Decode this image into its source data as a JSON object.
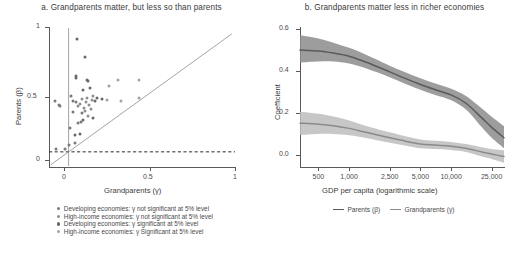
{
  "figure": {
    "width": 526,
    "height": 257,
    "background": "#ffffff"
  },
  "colors": {
    "parents_line": "#5a5a5a",
    "parents_band": "#8c8c8c",
    "grandparents_line": "#8a8a8a",
    "grandparents_band": "#bdbdbd",
    "axis": "#595959",
    "dashed_zero": "#2f2f2f",
    "dot_dev_ns": "#7a7a7a",
    "dot_hi_ns": "#8e8e8e",
    "dot_dev_s": "#686868",
    "dot_hi_s": "#a3a3a3",
    "text": "#3b3b3b"
  },
  "panel_a": {
    "title": "a. Grandparents matter, but less so than parents",
    "xlabel": "Grandparents (γ)",
    "ylabel": "Parents (β)",
    "xticks": [
      "0",
      "0.5",
      "1"
    ],
    "yticks": [
      "0",
      "0.5",
      "1"
    ],
    "legend": [
      {
        "label": "Developing economies: γ not significant at 5% level",
        "color": "#7a7a7a"
      },
      {
        "label": "High-income economies: γ not significant at 5% level",
        "color": "#8e8e8e"
      },
      {
        "label": "Developing economies:  γ significant at 5% level",
        "color": "#686868"
      },
      {
        "label": "High-income economies: γ Significant at 5% level",
        "color": "#a3a3a3"
      }
    ]
  },
  "panel_b": {
    "title": "b. Grandparents matter less in richer economies",
    "xlabel": "GDP per capita (logarithmic scale)",
    "ylabel": "Coefficient",
    "xticks": [
      "500",
      "1,000",
      "2,500",
      "5,000",
      "10,000",
      "25,000"
    ],
    "yticks": [
      "0.0",
      "0.2",
      "0.4",
      "0.6"
    ],
    "legend": [
      {
        "label": "Parents (β)",
        "color": "#5a5a5a"
      },
      {
        "label": "Grandparents (γ)",
        "color": "#8a8a8a"
      }
    ]
  },
  "chart_data": [
    {
      "type": "scatter",
      "panel": "a",
      "title": "a. Grandparents matter, but less so than parents",
      "xlabel": "Grandparents (γ)",
      "ylabel": "Parents (β)",
      "xlim": [
        -0.12,
        1.02
      ],
      "ylim": [
        -0.12,
        1.05
      ],
      "xticks": [
        0,
        0.5,
        1
      ],
      "yticks": [
        0,
        0.5,
        1
      ],
      "grid": false,
      "annotations": [
        {
          "kind": "vline",
          "x": 0,
          "note": "vertical reference line at gamma = 0"
        },
        {
          "kind": "hline",
          "y": 0,
          "style": "dashed",
          "note": "horizontal reference line at beta = 0"
        },
        {
          "kind": "line",
          "note": "45-degree identity line beta = gamma",
          "from": [
            -0.11,
            -0.11
          ],
          "to": [
            1.0,
            1.0
          ]
        }
      ],
      "series": [
        {
          "name": "Developing economies: γ not significant at 5% level",
          "color": "#7a7a7a",
          "points": [
            [
              -0.085,
              0.435
            ],
            [
              -0.06,
              0.395
            ],
            [
              -0.05,
              0.392
            ],
            [
              -0.075,
              0.02
            ],
            [
              -0.02,
              0.02
            ],
            [
              0.0,
              0.055
            ],
            [
              0.04,
              0.072
            ],
            [
              0.01,
              0.205
            ],
            [
              0.055,
              0.245
            ],
            [
              0.075,
              0.25
            ],
            [
              0.03,
              0.335
            ],
            [
              0.085,
              0.33
            ],
            [
              0.012,
              0.47
            ],
            [
              0.03,
              0.43
            ],
            [
              0.048,
              0.425
            ]
          ]
        },
        {
          "name": "High-income economies: γ not significant at 5% level",
          "color": "#8e8e8e",
          "points": [
            [
              0.06,
              0.39
            ],
            [
              0.072,
              0.405
            ],
            [
              0.085,
              0.445
            ],
            [
              0.095,
              0.37
            ],
            [
              0.1,
              0.345
            ],
            [
              0.108,
              0.42
            ],
            [
              0.115,
              0.455
            ],
            [
              0.12,
              0.3
            ],
            [
              0.128,
              0.395
            ],
            [
              0.136,
              0.36
            ],
            [
              0.142,
              0.44
            ],
            [
              0.15,
              0.47
            ]
          ]
        },
        {
          "name": "Developing economies:  γ significant at 5% level",
          "color": "#686868",
          "points": [
            [
              0.052,
              0.955
            ],
            [
              0.098,
              0.8
            ],
            [
              0.048,
              0.64
            ],
            [
              0.048,
              0.625
            ],
            [
              0.11,
              0.61
            ],
            [
              0.122,
              0.6
            ],
            [
              0.13,
              0.54
            ],
            [
              0.09,
              0.525
            ],
            [
              0.16,
              0.43
            ],
            [
              0.175,
              0.455
            ],
            [
              0.205,
              0.45
            ],
            [
              0.148,
              0.29
            ],
            [
              0.09,
              0.27
            ],
            [
              0.068,
              0.15
            ],
            [
              0.04,
              0.145
            ]
          ]
        },
        {
          "name": "High-income economies: γ Significant at 5% level",
          "color": "#a3a3a3",
          "points": [
            [
              0.3,
              0.61
            ],
            [
              0.43,
              0.61
            ],
            [
              0.32,
              0.43
            ],
            [
              0.43,
              0.455
            ],
            [
              0.235,
              0.44
            ],
            [
              0.245,
              0.56
            ]
          ]
        }
      ]
    },
    {
      "type": "line",
      "panel": "b",
      "title": "b. Grandparents matter less in richer economies",
      "xlabel": "GDP per capita (logarithmic scale)",
      "ylabel": "Coefficient",
      "xscale": "log",
      "xlim": [
        330,
        33000
      ],
      "ylim": [
        -0.045,
        0.615
      ],
      "xticks": [
        500,
        1000,
        2500,
        5000,
        10000,
        25000
      ],
      "xticklabels": [
        "500",
        "1,000",
        "2,500",
        "5,000",
        "10,000",
        "25,000"
      ],
      "yticks": [
        0.0,
        0.2,
        0.4,
        0.6
      ],
      "grid": false,
      "legend_position": "bottom",
      "x": [
        330,
        500,
        700,
        1000,
        1500,
        2500,
        3500,
        5000,
        7000,
        10000,
        14000,
        20000,
        25000,
        33000
      ],
      "series": [
        {
          "name": "Parents (β)",
          "color": "#5a5a5a",
          "band_color": "#8c8c8c",
          "values": [
            0.51,
            0.505,
            0.495,
            0.48,
            0.45,
            0.405,
            0.375,
            0.345,
            0.32,
            0.295,
            0.255,
            0.185,
            0.14,
            0.09
          ],
          "lower": [
            0.45,
            0.455,
            0.455,
            0.445,
            0.42,
            0.38,
            0.35,
            0.32,
            0.295,
            0.27,
            0.225,
            0.14,
            0.09,
            0.04
          ],
          "upper": [
            0.58,
            0.565,
            0.545,
            0.52,
            0.485,
            0.435,
            0.405,
            0.375,
            0.35,
            0.325,
            0.29,
            0.23,
            0.19,
            0.145
          ]
        },
        {
          "name": "Grandparents (γ)",
          "color": "#8a8a8a",
          "band_color": "#bdbdbd",
          "values": [
            0.16,
            0.155,
            0.148,
            0.135,
            0.115,
            0.09,
            0.075,
            0.06,
            0.055,
            0.05,
            0.04,
            0.022,
            0.012,
            0.0
          ],
          "lower": [
            0.103,
            0.108,
            0.108,
            0.102,
            0.088,
            0.066,
            0.053,
            0.04,
            0.036,
            0.032,
            0.022,
            0.0,
            -0.012,
            -0.03
          ],
          "upper": [
            0.215,
            0.205,
            0.192,
            0.173,
            0.145,
            0.116,
            0.098,
            0.082,
            0.076,
            0.07,
            0.06,
            0.045,
            0.036,
            0.03
          ]
        }
      ]
    }
  ]
}
